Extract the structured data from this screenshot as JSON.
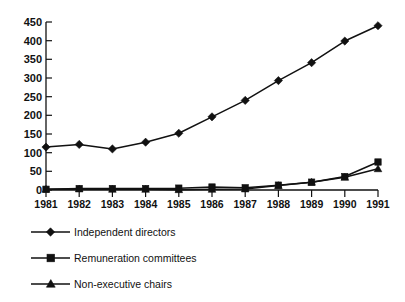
{
  "chart_data": {
    "type": "line",
    "title": "",
    "subtitle": "",
    "xlabel": "",
    "ylabel": "",
    "categories": [
      "1981",
      "1982",
      "1983",
      "1984",
      "1985",
      "1986",
      "1987",
      "1988",
      "1989",
      "1990",
      "1991"
    ],
    "x": [
      1981,
      1982,
      1983,
      1984,
      1985,
      1986,
      1987,
      1988,
      1989,
      1990,
      1991
    ],
    "series": [
      {
        "name": "Independent directors",
        "marker": "diamond",
        "color": "#111111",
        "values": [
          115,
          122,
          110,
          128,
          152,
          196,
          240,
          293,
          341,
          399,
          440
        ]
      },
      {
        "name": "Remuneration committees",
        "marker": "square",
        "color": "#111111",
        "values": [
          2,
          4,
          4,
          4,
          5,
          8,
          6,
          13,
          21,
          36,
          75
        ]
      },
      {
        "name": "Non-executive chairs",
        "marker": "triangle",
        "color": "#111111",
        "values": [
          2,
          3,
          2,
          2,
          1,
          2,
          3,
          12,
          21,
          34,
          57
        ]
      }
    ],
    "ylim": [
      0,
      450
    ],
    "ytick_values": [
      0,
      50,
      100,
      150,
      200,
      250,
      300,
      350,
      400,
      450
    ],
    "ytick_labels": [
      "0",
      "50",
      "100",
      "150",
      "200",
      "250",
      "300",
      "350",
      "400",
      "450"
    ],
    "xlim": [
      1981,
      1991
    ],
    "grid": false,
    "legend_position": "bottom-left"
  },
  "legend": {
    "items": [
      {
        "label": "Independent directors",
        "marker": "diamond-marker-icon"
      },
      {
        "label": "Remuneration committees",
        "marker": "square-marker-icon"
      },
      {
        "label": "Non-executive chairs",
        "marker": "triangle-marker-icon"
      }
    ]
  }
}
